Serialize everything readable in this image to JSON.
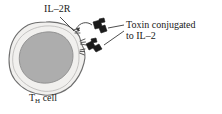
{
  "figure": {
    "type": "biology-diagram",
    "background_color": "#ffffff"
  },
  "labels": {
    "receptor": "IL–2R",
    "toxin_line1": "Toxin conjugated",
    "toxin_line2": "to IL–2",
    "cell_prefix": "T",
    "cell_subscript": "H",
    "cell_suffix": " cell"
  },
  "colors": {
    "outline": "#6e6e6e",
    "cytoplasm": "#f1f0ee",
    "nucleus": "#adadad",
    "nucleus_outline": "#8d8d8d",
    "toxin": "#1b1b1b",
    "leader_line": "#3a3a3a",
    "text": "#1a1a1a"
  },
  "elements": {
    "cell_name": "th-cell-body",
    "nucleus_name": "cell-nucleus",
    "receptors": [
      {
        "name": "il2r-receptor-upper"
      },
      {
        "name": "il2r-receptor-middle"
      },
      {
        "name": "il2r-receptor-lower"
      }
    ],
    "toxins": [
      {
        "name": "toxin-il2-conjugate-upper"
      },
      {
        "name": "toxin-il2-conjugate-lower"
      }
    ],
    "arrows": [
      {
        "name": "binding-arrow"
      },
      {
        "name": "il2r-leader-line"
      },
      {
        "name": "toxin-leader-line-upper"
      },
      {
        "name": "toxin-leader-line-lower"
      }
    ]
  }
}
